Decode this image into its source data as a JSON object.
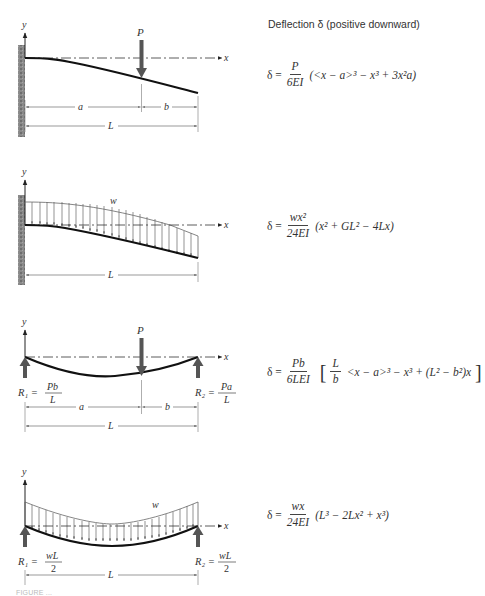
{
  "header": {
    "title": "Deflection δ (positive downward)"
  },
  "cases": [
    {
      "name": "cantilever-point-load",
      "support": "fixed wall at left",
      "labels": {
        "y_axis": "y",
        "x_axis": "x",
        "load": "P",
        "dim_a": "a",
        "dim_b": "b",
        "dim_L": "L"
      },
      "formula": {
        "lhs": "δ =",
        "numerator": "P",
        "denominator": "6EI",
        "expression": "(<x − a>³ − x³ + 3x²a)"
      }
    },
    {
      "name": "cantilever-uniform-load",
      "support": "fixed wall at left",
      "labels": {
        "y_axis": "y",
        "x_axis": "x",
        "load": "w",
        "dim_L": "L"
      },
      "formula": {
        "lhs": "δ =",
        "numerator": "wx²",
        "denominator": "24EI",
        "expression": "(x² + GL² − 4Lx)"
      }
    },
    {
      "name": "simply-supported-point-load",
      "support": "simple supports at both ends",
      "labels": {
        "y_axis": "y",
        "x_axis": "x",
        "load": "P",
        "dim_a": "a",
        "dim_b": "b",
        "dim_L": "L",
        "r1_label": "R₁ =",
        "r1_num": "Pb",
        "r1_den": "L",
        "r2_label": "R₂ =",
        "r2_num": "Pa",
        "r2_den": "L"
      },
      "formula": {
        "lhs": "δ =",
        "numerator": "Pb",
        "denominator": "6LEI",
        "bracket_open": "[",
        "inner_num": "L",
        "inner_den": "b",
        "expression": "<x − a>³ − x³ + (L² − b²)x",
        "bracket_close": "]"
      }
    },
    {
      "name": "simply-supported-uniform-load",
      "support": "simple supports at both ends",
      "labels": {
        "y_axis": "y",
        "x_axis": "x",
        "load": "w",
        "dim_L": "L",
        "r1_label": "R₁ =",
        "r1_num": "wL",
        "r1_den": "2",
        "r2_label": "R₂ =",
        "r2_num": "wL",
        "r2_den": "2"
      },
      "formula": {
        "lhs": "δ =",
        "numerator": "wx",
        "denominator": "24EI",
        "expression": "(L³ − 2Lx² + x³)"
      }
    }
  ],
  "caption": "FIGURE ..."
}
